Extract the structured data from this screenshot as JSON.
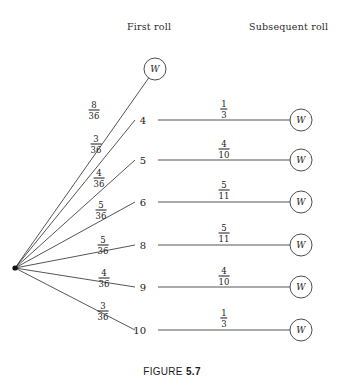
{
  "figure": {
    "caption_word": "FIGURE",
    "caption_number": "5.7"
  },
  "headers": {
    "first_roll": "First roll",
    "subsequent_roll": "Subsequent roll"
  },
  "stage_one": {
    "branches": [
      {
        "id": "win",
        "label": "W",
        "prob_num": "8",
        "prob_den": "36",
        "node_type": "circle"
      },
      {
        "id": "four",
        "label": "4",
        "prob_num": "3",
        "prob_den": "36",
        "node_type": "text"
      },
      {
        "id": "five",
        "label": "5",
        "prob_num": "4",
        "prob_den": "36",
        "node_type": "text"
      },
      {
        "id": "six",
        "label": "6",
        "prob_num": "5",
        "prob_den": "36",
        "node_type": "text"
      },
      {
        "id": "eight",
        "label": "8",
        "prob_num": "5",
        "prob_den": "36",
        "node_type": "text"
      },
      {
        "id": "nine",
        "label": "9",
        "prob_num": "4",
        "prob_den": "36",
        "node_type": "text"
      },
      {
        "id": "ten",
        "label": "10",
        "prob_num": "3",
        "prob_den": "36",
        "node_type": "text"
      }
    ]
  },
  "stage_two": {
    "branches": [
      {
        "id": "four",
        "from": "4",
        "prob_num": "1",
        "prob_den": "3",
        "label": "W"
      },
      {
        "id": "five",
        "from": "5",
        "prob_num": "4",
        "prob_den": "10",
        "label": "W"
      },
      {
        "id": "six",
        "from": "6",
        "prob_num": "5",
        "prob_den": "11",
        "label": "W"
      },
      {
        "id": "eight",
        "from": "8",
        "prob_num": "5",
        "prob_den": "11",
        "label": "W"
      },
      {
        "id": "nine",
        "from": "9",
        "prob_num": "4",
        "prob_den": "10",
        "label": "W"
      },
      {
        "id": "ten",
        "from": "10",
        "prob_num": "1",
        "prob_den": "3",
        "label": "W"
      }
    ]
  },
  "chart_data": {
    "type": "diagram",
    "subtype": "probability-tree",
    "root": {
      "x": 15,
      "y": 268,
      "style": "filled-dot"
    },
    "stage_labels": [
      "First roll",
      "Subsequent roll"
    ],
    "stage_one_outcomes": [
      "W",
      "4",
      "5",
      "6",
      "8",
      "9",
      "10"
    ],
    "stage_one_probabilities": [
      "8/36",
      "3/36",
      "4/36",
      "5/36",
      "5/36",
      "4/36",
      "3/36"
    ],
    "stage_two_outcomes": [
      "W",
      "W",
      "W",
      "W",
      "W",
      "W"
    ],
    "stage_two_probabilities": [
      "1/3",
      "4/10",
      "5/11",
      "5/11",
      "4/10",
      "1/3"
    ],
    "stroke_color": "#2a2a2a",
    "background": "#ffffff"
  },
  "geometry": {
    "root": {
      "x": 15,
      "y": 268
    },
    "stage_one_nodes": [
      {
        "id": "win",
        "x": 155,
        "y": 69,
        "circle": true
      },
      {
        "id": "four",
        "x": 148,
        "y": 120,
        "circle": false
      },
      {
        "id": "five",
        "x": 148,
        "y": 160,
        "circle": false
      },
      {
        "id": "six",
        "x": 148,
        "y": 202,
        "circle": false
      },
      {
        "id": "eight",
        "x": 148,
        "y": 245,
        "circle": false
      },
      {
        "id": "nine",
        "x": 148,
        "y": 287,
        "circle": false
      },
      {
        "id": "ten",
        "x": 148,
        "y": 330,
        "circle": false
      }
    ],
    "stage_two_nodes": [
      {
        "id": "four",
        "x": 301,
        "y": 120
      },
      {
        "id": "five",
        "x": 301,
        "y": 160
      },
      {
        "id": "six",
        "x": 301,
        "y": 202
      },
      {
        "id": "eight",
        "x": 301,
        "y": 245
      },
      {
        "id": "nine",
        "x": 301,
        "y": 287
      },
      {
        "id": "ten",
        "x": 301,
        "y": 330
      }
    ],
    "stage_one_frac_pos": [
      {
        "id": "win",
        "x": 94,
        "y": 110
      },
      {
        "id": "four",
        "x": 96,
        "y": 144
      },
      {
        "id": "five",
        "x": 99,
        "y": 178
      },
      {
        "id": "six",
        "x": 101,
        "y": 210
      },
      {
        "id": "eight",
        "x": 103,
        "y": 245
      },
      {
        "id": "nine",
        "x": 104,
        "y": 278
      },
      {
        "id": "ten",
        "x": 103,
        "y": 311
      }
    ],
    "stage_two_frac_pos": [
      {
        "id": "four",
        "x": 224,
        "y": 109
      },
      {
        "id": "five",
        "x": 224,
        "y": 149
      },
      {
        "id": "six",
        "x": 224,
        "y": 190
      },
      {
        "id": "eight",
        "x": 224,
        "y": 233
      },
      {
        "id": "nine",
        "x": 224,
        "y": 276
      },
      {
        "id": "ten",
        "x": 224,
        "y": 318
      }
    ],
    "circle_radius": 11
  }
}
